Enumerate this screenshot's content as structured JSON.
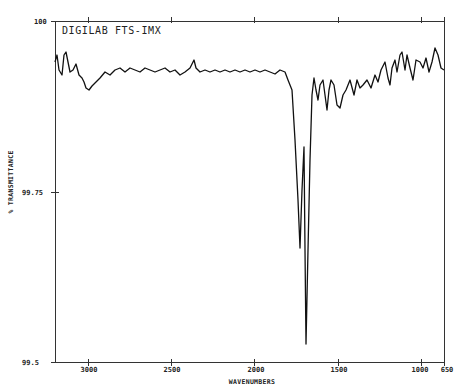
{
  "chart_data": {
    "type": "line",
    "title": "DIGILAB FTS-IMX",
    "xlabel": "WAVENUMBERS",
    "ylabel": "% TRANSMITTANCE",
    "xlim": [
      3200,
      650
    ],
    "ylim": [
      99.5,
      100
    ],
    "x_reversed": true,
    "grid": false,
    "legend": null,
    "x_ticks": [
      3000,
      2500,
      2000,
      1500,
      1000,
      650
    ],
    "x_tick_labels": [
      "3000",
      "2500",
      "2000",
      "1500",
      "1000",
      "650"
    ],
    "y_ticks": [
      100,
      99.75,
      99.5
    ],
    "y_tick_labels": [
      "100",
      "99.75",
      "99.5"
    ],
    "series": [
      {
        "name": "spectrum",
        "x": [
          3198,
          3186,
          3174,
          3156,
          3144,
          3132,
          3120,
          3108,
          3090,
          3072,
          3054,
          3036,
          3024,
          3012,
          2994,
          2976,
          2952,
          2928,
          2898,
          2868,
          2838,
          2808,
          2778,
          2748,
          2718,
          2688,
          2658,
          2628,
          2598,
          2568,
          2538,
          2508,
          2478,
          2448,
          2418,
          2388,
          2364,
          2352,
          2328,
          2298,
          2268,
          2238,
          2208,
          2178,
          2148,
          2118,
          2088,
          2058,
          2028,
          1998,
          1968,
          1938,
          1908,
          1878,
          1848,
          1830,
          1806,
          1788,
          1770,
          1758,
          1746,
          1734,
          1728,
          1722,
          1710,
          1698,
          1686,
          1674,
          1662,
          1650,
          1638,
          1620,
          1608,
          1596,
          1584,
          1572,
          1554,
          1536,
          1518,
          1500,
          1476,
          1452,
          1434,
          1416,
          1398,
          1374,
          1350,
          1332,
          1314,
          1290,
          1272,
          1260,
          1248,
          1230,
          1218,
          1200,
          1188,
          1170,
          1158,
          1140,
          1122,
          1098,
          1080,
          1062,
          1044,
          1026,
          1008,
          990,
          972,
          954,
          936
        ],
        "y": [
          99.94,
          99.951,
          99.928,
          99.921,
          99.951,
          99.954,
          99.94,
          99.925,
          99.928,
          99.937,
          99.921,
          99.916,
          99.911,
          99.902,
          99.899,
          99.905,
          99.911,
          99.916,
          99.925,
          99.921,
          99.928,
          99.931,
          99.925,
          99.931,
          99.928,
          99.925,
          99.931,
          99.928,
          99.925,
          99.928,
          99.931,
          99.925,
          99.928,
          99.925,
          99.921,
          99.925,
          99.943,
          99.931,
          99.925,
          99.928,
          99.925,
          99.928,
          99.925,
          99.928,
          99.925,
          99.928,
          99.925,
          99.928,
          99.925,
          99.928,
          99.925,
          99.928,
          99.925,
          99.922,
          99.928,
          99.925,
          99.914,
          99.899,
          99.826,
          99.738,
          99.667,
          99.754,
          99.815,
          99.664,
          99.526,
          99.664,
          99.796,
          99.892,
          99.916,
          99.899,
          99.884,
          99.906,
          99.914,
          99.892,
          99.87,
          99.899,
          99.914,
          99.906,
          99.877,
          99.873,
          99.892,
          99.899,
          99.914,
          99.892,
          99.914,
          99.902,
          99.906,
          99.914,
          99.902,
          99.921,
          99.906,
          99.924,
          99.94,
          99.916,
          99.906,
          99.931,
          99.943,
          99.924,
          99.95,
          99.955,
          99.928,
          99.95,
          99.931,
          99.912,
          99.941,
          99.94,
          99.931,
          99.946,
          99.925,
          99.94,
          99.962
        ],
        "color": "#111111"
      }
    ],
    "annotations": [
      {
        "text": "DIGILAB FTS-IMX",
        "position": "top-left inside plot"
      }
    ],
    "minima": [
      {
        "x": 1722,
        "y": 99.664,
        "label": "first sharp dip"
      },
      {
        "x": 1698,
        "y": 99.526,
        "label": "strongest band"
      }
    ]
  },
  "render": {
    "plot": {
      "left": 55,
      "top": 21,
      "right": 444,
      "bottom": 362
    },
    "trace_points": "55,62 57,55 59,70 62,75 64,55 66,52 68,62 70,72 73,70 76,64 79,75 82,78 84,82 86,88 89,90 92,86 96,82 100,78 105,72 110,75 115,70 120,68 125,72 130,68 135,70 140,72 145,68 150,70 155,72 160,70 165,68 170,72 175,70 180,75 185,72 190,68 194,60 196,68 200,72 205,70 210,72 215,70 220,72 225,70 230,72 235,70 240,72 245,70 250,72 255,70 260,72 265,70 270,72 275,74 280,70 285,72 288,80 292,90 295,140 298,200 300,248 302,190 304,147 305,250 306,344 308,250 310,160 312,95 314,78 316,90 318,100 320,85 323,80 325,95 327,110 329,90 331,80 334,85 337,105 340,108 343,95 346,90 350,80 354,95 357,80 360,88 363,85 367,80 371,88 375,75 378,82 381,70 385,62 388,78 390,85 392,68 395,60 397,72 400,55 402,52 405,70 407,55 410,68 413,80 416,60 420,62 423,68 426,58 429,72 432,62 435,48 438,55 441,68 444,70",
    "x_tick_px": [
      88,
      171,
      254,
      338,
      421,
      444
    ],
    "y_tick_px": [
      21,
      192,
      362
    ]
  }
}
